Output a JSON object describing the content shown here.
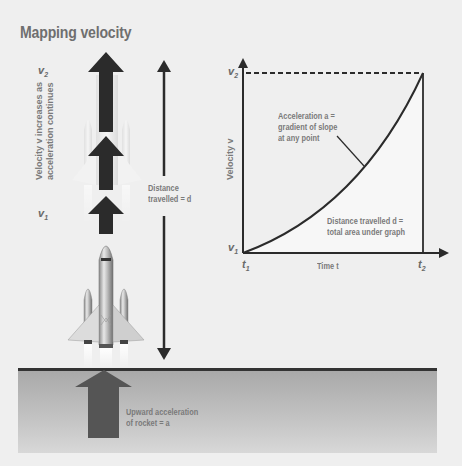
{
  "title": "Mapping velocity",
  "rocket_side": {
    "v2_label": "v",
    "v2_sub": "2",
    "v1_label": "v",
    "v1_sub": "1",
    "velocity_note_line1": "Velocity v increases as",
    "velocity_note_line2": "acceleration continues",
    "distance_label_line1": "Distance",
    "distance_label_line2": "travelled = d",
    "acceleration_label_line1": "Upward acceleration",
    "acceleration_label_line2": "of rocket = a"
  },
  "graph": {
    "y_axis_label": "Velocity v",
    "x_axis_label": "Time t",
    "y_top_label": "v",
    "y_top_sub": "2",
    "y_bottom_label": "v",
    "y_bottom_sub": "1",
    "x_left_label": "t",
    "x_left_sub": "1",
    "x_right_label": "t",
    "x_right_sub": "2",
    "gradient_note_line1": "Acceleration a =",
    "gradient_note_line2": "gradient of slope",
    "gradient_note_line3": "at any point",
    "area_note_line1": "Distance travelled d =",
    "area_note_line2": "total area under graph"
  },
  "colors": {
    "background": "#efefef",
    "arrow": "#2b2b2b",
    "text": "#7a7a7a",
    "ground_arrow": "#555555"
  }
}
